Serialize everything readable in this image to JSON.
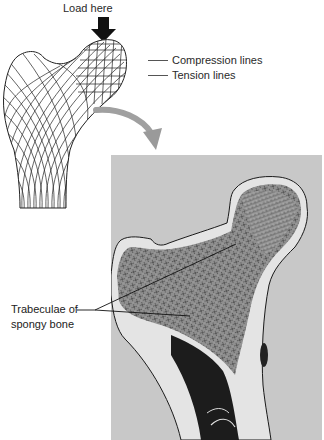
{
  "diagram": {
    "load_label": "Load here",
    "legend": {
      "items": [
        {
          "label": "Compression lines"
        },
        {
          "label": "Tension lines"
        }
      ]
    },
    "callout": {
      "line1": "Trabeculae of",
      "line2": "spongy bone"
    },
    "colors": {
      "photo_background": "#c8c8c8",
      "arrow_gray": "#9a9a9a",
      "line_black": "#111111",
      "bone_light": "#e6e6e6",
      "marrow_dark": "#1a1a1a"
    }
  }
}
